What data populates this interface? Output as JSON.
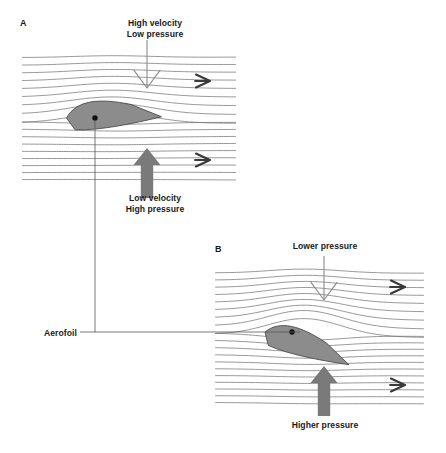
{
  "figure": {
    "type": "diagram",
    "background": "#ffffff"
  },
  "colors": {
    "streamline": "#6e6e6e",
    "aerofoil_fill": "#8c8c8c",
    "aerofoil_stroke": "#4d4d4d",
    "thick_arrow": "#7a7a7a",
    "thin_arrow": "#8a8a8a",
    "flow_chevron": "#3a3a3a",
    "text": "#1a1a1a",
    "leader_line": "#555555"
  },
  "connector": {
    "label": "Aerofoil",
    "label_x": 44,
    "label_y": 328,
    "horizontal_y": 332,
    "horizontal_x1": 80,
    "horizontal_x2": 300,
    "vertical_x": 95,
    "vertical_y1": 120,
    "vertical_y2": 332
  },
  "panels": [
    {
      "id": "A",
      "letter": "A",
      "letter_x": 20,
      "letter_y": 18,
      "box": {
        "x": 22,
        "y": 52,
        "width": 214,
        "height": 133
      },
      "streamline_count": 20,
      "aerofoil": {
        "name": "aerofoil-horizontal",
        "angle_of_attack_deg": 0,
        "center_x": 95,
        "center_y": 118,
        "chord": 95,
        "dot_x": 95,
        "dot_y": 118
      },
      "top_label": {
        "text": "High velocity\nLow pressure",
        "lines": [
          "High velocity",
          "Low pressure"
        ],
        "x": 100,
        "y": 18,
        "width": 110
      },
      "bottom_label": {
        "text": "Low velocity\nHigh pressure",
        "lines": [
          "Low velocity",
          "High pressure"
        ],
        "x": 100,
        "y": 193,
        "width": 110
      },
      "down_arrow": {
        "style": "thin-outline",
        "x": 147,
        "y_top": 40,
        "y_tip": 88
      },
      "up_arrow": {
        "style": "thick-filled",
        "x": 147,
        "y_base": 198,
        "y_tip": 148
      },
      "flow_chevrons": [
        {
          "x": 205,
          "y": 81
        },
        {
          "x": 205,
          "y": 160
        }
      ]
    },
    {
      "id": "B",
      "letter": "B",
      "letter_x": 215,
      "letter_y": 244,
      "box": {
        "x": 215,
        "y": 268,
        "width": 209,
        "height": 140
      },
      "streamline_count": 22,
      "aerofoil": {
        "name": "aerofoil-inclined",
        "angle_of_attack_deg": 22,
        "center_x": 292,
        "center_y": 332,
        "chord": 90,
        "dot_x": 292,
        "dot_y": 332
      },
      "top_label": {
        "text": "Lower pressure",
        "lines": [
          "Lower pressure"
        ],
        "x": 270,
        "y": 241,
        "width": 110
      },
      "bottom_label": {
        "text": "Higher pressure",
        "lines": [
          "Higher pressure"
        ],
        "x": 270,
        "y": 420,
        "width": 110
      },
      "down_arrow": {
        "style": "thin-outline",
        "x": 324,
        "y_top": 256,
        "y_tip": 300
      },
      "up_arrow": {
        "style": "thick-filled",
        "x": 324,
        "y_base": 416,
        "y_tip": 366
      },
      "flow_chevrons": [
        {
          "x": 400,
          "y": 287
        },
        {
          "x": 400,
          "y": 385
        }
      ]
    }
  ],
  "chart_data": {
    "type": "diagram",
    "annotations": [
      "High velocity",
      "Low pressure",
      "Low velocity",
      "High pressure",
      "Lower pressure",
      "Higher pressure",
      "Aerofoil",
      "A",
      "B"
    ],
    "panel_A_description": "Horizontal aerofoil with streamlines compressed above (high velocity, low pressure) and evenly spaced below (low velocity, high pressure)",
    "panel_B_description": "Aerofoil inclined at angle of attack producing stronger streamline deflection, lower pressure above and higher pressure below"
  }
}
